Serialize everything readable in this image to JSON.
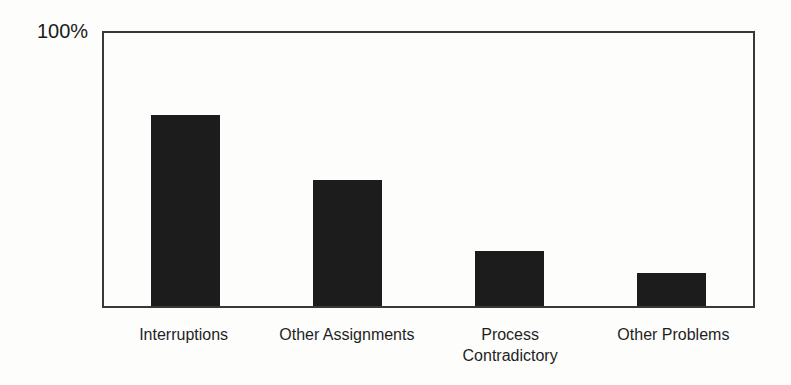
{
  "chart_data": {
    "type": "bar",
    "title": "",
    "xlabel": "",
    "ylabel": "",
    "categories": [
      "Interruptions",
      "Other Assignments",
      "Process\nContradictory",
      "Other Problems"
    ],
    "values": [
      70,
      46,
      20,
      12
    ],
    "ylim": [
      0,
      100
    ],
    "y_max_label": "100%",
    "bar_color": "#1c1c1c",
    "border_color": "#383838",
    "background_color": "#fdfdfc",
    "grid": false,
    "legend": "none"
  }
}
